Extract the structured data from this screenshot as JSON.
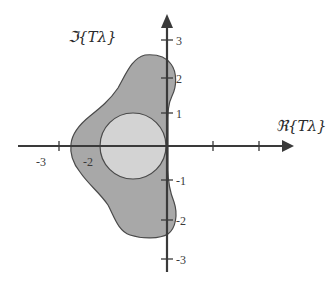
{
  "diagram": {
    "type": "complex-plane-stability-region",
    "colors": {
      "outer_region": "#a8a8a8",
      "inner_region": "#d3d3d3",
      "outline": "#4a4a4a",
      "axes": "#3a3a3a",
      "background": "#ffffff"
    },
    "axes": {
      "x_label": "ℜ{Tλ}",
      "y_label": "ℑ{Tλ}",
      "x_ticks": [
        {
          "value": "-3",
          "label": "-3"
        },
        {
          "value": "-2",
          "label": "-2"
        }
      ],
      "y_ticks": [
        {
          "value": "3",
          "label": "3"
        },
        {
          "value": "2",
          "label": "2"
        },
        {
          "value": "1",
          "label": "1"
        },
        {
          "value": "-1",
          "label": "-1"
        },
        {
          "value": "-2",
          "label": "-2"
        },
        {
          "value": "-3",
          "label": "-3"
        }
      ]
    },
    "regions": [
      {
        "name": "outer-stability-region",
        "description": "Larger irregular shaded region extending from about -2.3 to +0.2 on the real axis and -2.5 to +2.5 on the imaginary axis"
      },
      {
        "name": "inner-circle-region",
        "description": "Circle centered at -1 with radius 1"
      }
    ]
  }
}
